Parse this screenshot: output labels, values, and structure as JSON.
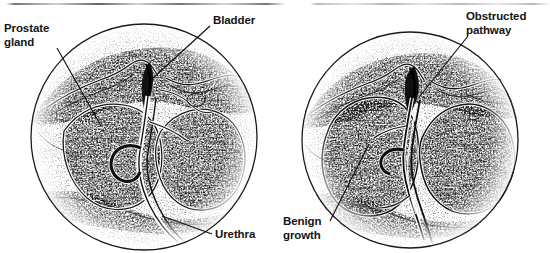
{
  "figure": {
    "type": "medical-illustration",
    "style": "stipple-engraving-grayscale",
    "panel_count": 2,
    "background_color": "#ffffff",
    "ink_color": "#141414",
    "tissue_tone": "#8a8a8a"
  },
  "artifact": {
    "name": "scanline",
    "description": "thin horizontal scan line across top of page"
  },
  "panels": [
    {
      "id": "normal-prostate",
      "title": "Normal prostate",
      "circle": {
        "cx": 144,
        "cy": 137,
        "r": 114
      },
      "labels": [
        {
          "id": "prostate-gland",
          "text": "Prostate\ngland",
          "x": 4,
          "y": 22,
          "leader": {
            "x1": 57,
            "y1": 48,
            "x2": 101,
            "y2": 126
          }
        },
        {
          "id": "bladder",
          "text": "Bladder",
          "x": 213,
          "y": 14,
          "leader": {
            "x1": 210,
            "y1": 26,
            "x2": 152,
            "y2": 79
          }
        },
        {
          "id": "urethra",
          "text": "Urethra",
          "x": 215,
          "y": 228,
          "leader": {
            "x1": 212,
            "y1": 234,
            "x2": 162,
            "y2": 216
          }
        }
      ]
    },
    {
      "id": "enlarged-prostate",
      "title": "Prostate with benign growth",
      "circle": {
        "cx": 410,
        "cy": 140,
        "r": 110
      },
      "labels": [
        {
          "id": "obstructed-pathway",
          "text": "Obstructed\npathway",
          "x": 466,
          "y": 10,
          "leader": {
            "x1": 468,
            "y1": 36,
            "x2": 420,
            "y2": 96
          }
        },
        {
          "id": "benign-growth",
          "text": "Benign\ngrowth",
          "x": 283,
          "y": 215,
          "leader": {
            "x1": 330,
            "y1": 221,
            "x2": 369,
            "y2": 144
          }
        }
      ]
    }
  ]
}
